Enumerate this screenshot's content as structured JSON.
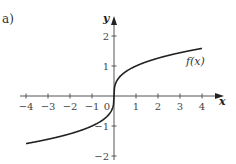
{
  "figure": {
    "part_label": "a)"
  },
  "chart_data": {
    "type": "line",
    "title": "",
    "xlabel": "x",
    "ylabel": "y",
    "xlim": [
      -4,
      4
    ],
    "ylim": [
      -2,
      2
    ],
    "x_ticks": [
      -4,
      -3,
      -2,
      -1,
      1,
      2,
      3,
      4
    ],
    "y_ticks": [
      -2,
      -1,
      1,
      2
    ],
    "origin_label": "0",
    "grid": false,
    "series": [
      {
        "name": "f(x)",
        "label_text": "f(x)",
        "x": [
          -4,
          -3,
          -2,
          -1,
          -0.5,
          -0.1,
          0,
          0.1,
          0.5,
          1,
          2,
          3,
          4
        ],
        "y": [
          -1.587,
          -1.442,
          -1.26,
          -1.0,
          -0.794,
          -0.464,
          0,
          0.464,
          0.794,
          1.0,
          1.26,
          1.442,
          1.587
        ]
      }
    ]
  }
}
